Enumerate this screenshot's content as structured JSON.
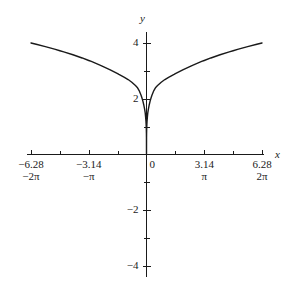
{
  "chart_data": {
    "type": "line",
    "title": "",
    "subtitle": "",
    "xlabel": "x",
    "ylabel": "y",
    "xlim": [
      -6.28,
      6.28
    ],
    "ylim": [
      -4,
      4
    ],
    "grid": false,
    "legend": null,
    "axis_style": "centered-cross",
    "function_expression": "y = 4 * (|x| / 6.28)^(1/4)",
    "x_ticks_major": [
      -6.28,
      -3.14,
      0,
      3.14,
      6.28
    ],
    "x_tick_labels_major": [
      "-6.28",
      "-3.14",
      "0",
      "3.14",
      "6.28"
    ],
    "x_tick_labels_secondary": [
      "-2π",
      "-π",
      "",
      "π",
      "2π"
    ],
    "x_ticks_minor": [
      -4.71,
      -1.57,
      1.57,
      4.71
    ],
    "y_ticks_major": [
      -4,
      -2,
      2,
      4
    ],
    "y_tick_labels_major": [
      "-4",
      "-2",
      "2",
      "4"
    ],
    "y_ticks_minor": [
      -3,
      -1,
      1,
      3
    ],
    "series": [
      {
        "name": "curve",
        "color": "#1a1a1a",
        "x": [
          -6.28,
          -6.0,
          -5.5,
          -5.0,
          -4.71,
          -4.5,
          -4.0,
          -3.5,
          -3.14,
          -3.0,
          -2.5,
          -2.0,
          -1.57,
          -1.5,
          -1.2,
          -1.0,
          -0.8,
          -0.6,
          -0.5,
          -0.4,
          -0.3,
          -0.25,
          -0.2,
          -0.15,
          -0.1,
          -0.07,
          -0.05,
          -0.03,
          -0.02,
          -0.01,
          -0.005,
          -0.002,
          0.0,
          0.002,
          0.005,
          0.01,
          0.02,
          0.03,
          0.05,
          0.07,
          0.1,
          0.15,
          0.2,
          0.25,
          0.3,
          0.4,
          0.5,
          0.6,
          0.8,
          1.0,
          1.2,
          1.5,
          1.57,
          2.0,
          2.5,
          3.0,
          3.14,
          3.5,
          4.0,
          4.5,
          4.71,
          5.0,
          5.5,
          6.0,
          6.28
        ],
        "y": [
          4.0,
          3.955,
          3.87,
          3.779,
          3.723,
          3.683,
          3.578,
          3.463,
          3.372,
          3.338,
          3.2,
          3.047,
          2.9,
          2.874,
          2.768,
          2.689,
          2.59,
          2.473,
          2.405,
          2.294,
          2.133,
          2.035,
          1.922,
          1.786,
          1.615,
          1.495,
          1.358,
          1.192,
          1.079,
          0.907,
          0.763,
          0.605,
          0.0,
          0.605,
          0.763,
          0.907,
          1.079,
          1.192,
          1.358,
          1.495,
          1.615,
          1.786,
          1.922,
          2.035,
          2.133,
          2.294,
          2.405,
          2.473,
          2.59,
          2.689,
          2.768,
          2.874,
          2.9,
          3.047,
          3.2,
          3.338,
          3.372,
          3.463,
          3.578,
          3.683,
          3.723,
          3.779,
          3.87,
          3.955,
          4.0
        ]
      }
    ]
  },
  "axes": {
    "x_axis_label": "x",
    "y_axis_label": "y",
    "origin_label": "0"
  },
  "colors": {
    "curve": "#1a1a1a",
    "axis": "#1a1a1a",
    "background": "#ffffff",
    "text": "#1a1a1a"
  }
}
